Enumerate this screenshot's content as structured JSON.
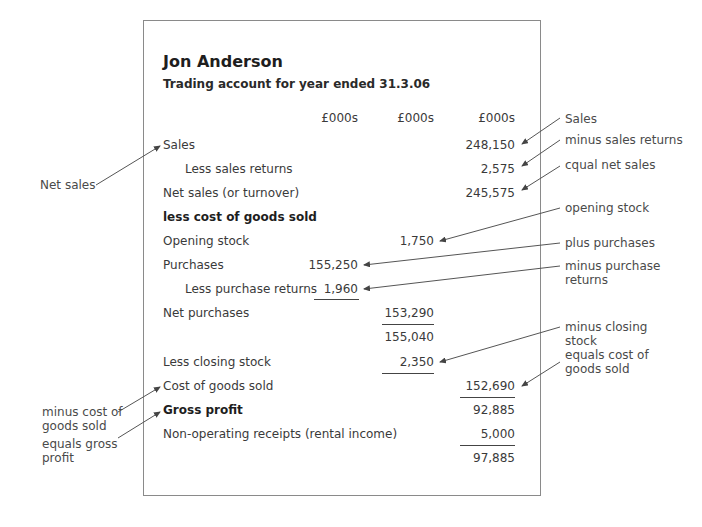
{
  "header": {
    "name": "Jon Anderson",
    "subtitle": "Trading account for year ended 31.3.06"
  },
  "columns": [
    "£000s",
    "£000s",
    "£000s"
  ],
  "rows": [
    {
      "label": "Sales",
      "col3": "248,150"
    },
    {
      "label": "Less sales returns",
      "col3": "2,575"
    },
    {
      "label": "Net sales (or turnover)",
      "col3": "245,575"
    },
    {
      "label": "less cost of goods sold"
    },
    {
      "label": "Opening stock",
      "col2": "1,750"
    },
    {
      "label": "Purchases",
      "col1": "155,250"
    },
    {
      "label": "Less purchase returns",
      "col1": "1,960"
    },
    {
      "label": "Net purchases",
      "col2": "153,290"
    },
    {
      "label": "",
      "col2": "155,040"
    },
    {
      "label": "Less closing stock",
      "col2": "2,350"
    },
    {
      "label": "Cost of goods sold",
      "col3": "152,690"
    },
    {
      "label": "Gross profit",
      "col3": "92,885"
    },
    {
      "label": "Non-operating receipts (rental income)",
      "col3": "5,000"
    },
    {
      "label": "",
      "col3": "97,885"
    }
  ],
  "annotations_right": {
    "sales": "Sales",
    "minus_sales_returns": "minus sales returns",
    "equal_net_sales": "cqual net sales",
    "opening_stock": "opening stock",
    "plus_purchases": "plus purchases",
    "minus_purchase_returns_1": "minus purchase",
    "minus_purchase_returns_2": "returns",
    "minus_closing_stock_1": "minus closing",
    "minus_closing_stock_2": "stock",
    "equals_cogs_1": "equals cost of",
    "equals_cogs_2": "goods sold"
  },
  "annotations_left": {
    "net_sales": "Net sales",
    "minus_cogs_1": "minus cost of",
    "minus_cogs_2": "goods sold",
    "equals_gross_1": "equals gross",
    "equals_gross_2": "profit"
  }
}
